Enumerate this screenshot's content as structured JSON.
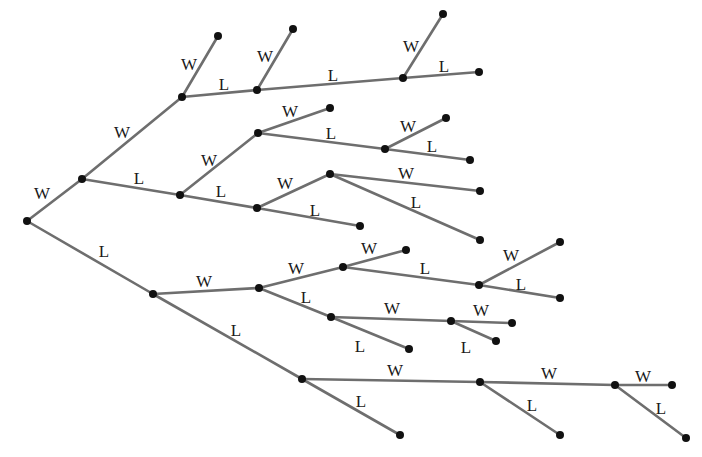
{
  "diagram": {
    "type": "win-loss tree",
    "branch_labels": {
      "win": "W",
      "loss": "L"
    },
    "colors": {
      "edge": "#6e6e6e",
      "node": "#111111",
      "text": "#1a1a1a",
      "background": "#ffffff"
    },
    "nodes": [
      {
        "id": "n0",
        "x": 27,
        "y": 221
      },
      {
        "id": "n1",
        "x": 82,
        "y": 179
      },
      {
        "id": "n2",
        "x": 153,
        "y": 294
      },
      {
        "id": "n3",
        "x": 182,
        "y": 97
      },
      {
        "id": "n4",
        "x": 180,
        "y": 195
      },
      {
        "id": "n5",
        "x": 218,
        "y": 36
      },
      {
        "id": "n6",
        "x": 257,
        "y": 90
      },
      {
        "id": "n7",
        "x": 293,
        "y": 29
      },
      {
        "id": "n8",
        "x": 403,
        "y": 78
      },
      {
        "id": "n9",
        "x": 443,
        "y": 14
      },
      {
        "id": "n10",
        "x": 479,
        "y": 72
      },
      {
        "id": "n11",
        "x": 258,
        "y": 133
      },
      {
        "id": "n12",
        "x": 257,
        "y": 208
      },
      {
        "id": "n13",
        "x": 330,
        "y": 108
      },
      {
        "id": "n14",
        "x": 385,
        "y": 149
      },
      {
        "id": "n15",
        "x": 446,
        "y": 118
      },
      {
        "id": "n16",
        "x": 470,
        "y": 160
      },
      {
        "id": "n17",
        "x": 330,
        "y": 174
      },
      {
        "id": "n18",
        "x": 360,
        "y": 226
      },
      {
        "id": "n19",
        "x": 480,
        "y": 191
      },
      {
        "id": "n20",
        "x": 480,
        "y": 240
      },
      {
        "id": "n21",
        "x": 259,
        "y": 288
      },
      {
        "id": "n22",
        "x": 302,
        "y": 379
      },
      {
        "id": "n23",
        "x": 343,
        "y": 267
      },
      {
        "id": "n24",
        "x": 331,
        "y": 317
      },
      {
        "id": "n25",
        "x": 406,
        "y": 250
      },
      {
        "id": "n26",
        "x": 479,
        "y": 285
      },
      {
        "id": "n27",
        "x": 560,
        "y": 242
      },
      {
        "id": "n28",
        "x": 560,
        "y": 298
      },
      {
        "id": "n29",
        "x": 451,
        "y": 321
      },
      {
        "id": "n30",
        "x": 409,
        "y": 349
      },
      {
        "id": "n31",
        "x": 512,
        "y": 323
      },
      {
        "id": "n32",
        "x": 496,
        "y": 341
      },
      {
        "id": "n33",
        "x": 480,
        "y": 382
      },
      {
        "id": "n34",
        "x": 400,
        "y": 435
      },
      {
        "id": "n35",
        "x": 615,
        "y": 385
      },
      {
        "id": "n36",
        "x": 560,
        "y": 435
      },
      {
        "id": "n37",
        "x": 672,
        "y": 385
      },
      {
        "id": "n38",
        "x": 686,
        "y": 438
      }
    ],
    "edges": [
      {
        "from": "n0",
        "to": "n1",
        "label": "W",
        "lx": 42,
        "ly": 195
      },
      {
        "from": "n0",
        "to": "n2",
        "label": "L",
        "lx": 104,
        "ly": 253
      },
      {
        "from": "n1",
        "to": "n3",
        "label": "W",
        "lx": 122,
        "ly": 134
      },
      {
        "from": "n1",
        "to": "n4",
        "label": "L",
        "lx": 139,
        "ly": 180
      },
      {
        "from": "n3",
        "to": "n5",
        "label": "W",
        "lx": 189,
        "ly": 66
      },
      {
        "from": "n3",
        "to": "n6",
        "label": "L",
        "lx": 224,
        "ly": 86
      },
      {
        "from": "n6",
        "to": "n7",
        "label": "W",
        "lx": 265,
        "ly": 58
      },
      {
        "from": "n6",
        "to": "n8",
        "label": "L",
        "lx": 333,
        "ly": 77
      },
      {
        "from": "n8",
        "to": "n9",
        "label": "W",
        "lx": 411,
        "ly": 48
      },
      {
        "from": "n8",
        "to": "n10",
        "label": "L",
        "lx": 444,
        "ly": 68
      },
      {
        "from": "n4",
        "to": "n11",
        "label": "W",
        "lx": 209,
        "ly": 162
      },
      {
        "from": "n4",
        "to": "n12",
        "label": "L",
        "lx": 221,
        "ly": 193
      },
      {
        "from": "n11",
        "to": "n13",
        "label": "W",
        "lx": 290,
        "ly": 113
      },
      {
        "from": "n11",
        "to": "n14",
        "label": "L",
        "lx": 331,
        "ly": 135
      },
      {
        "from": "n14",
        "to": "n15",
        "label": "W",
        "lx": 408,
        "ly": 128
      },
      {
        "from": "n14",
        "to": "n16",
        "label": "L",
        "lx": 432,
        "ly": 148
      },
      {
        "from": "n12",
        "to": "n17",
        "label": "W",
        "lx": 285,
        "ly": 185
      },
      {
        "from": "n12",
        "to": "n18",
        "label": "L",
        "lx": 315,
        "ly": 212
      },
      {
        "from": "n17",
        "to": "n19",
        "label": "W",
        "lx": 406,
        "ly": 175
      },
      {
        "from": "n17",
        "to": "n20",
        "label": "L",
        "lx": 416,
        "ly": 204
      },
      {
        "from": "n2",
        "to": "n21",
        "label": "W",
        "lx": 204,
        "ly": 283
      },
      {
        "from": "n2",
        "to": "n22",
        "label": "L",
        "lx": 236,
        "ly": 332
      },
      {
        "from": "n21",
        "to": "n23",
        "label": "W",
        "lx": 296,
        "ly": 270
      },
      {
        "from": "n21",
        "to": "n24",
        "label": "L",
        "lx": 306,
        "ly": 299
      },
      {
        "from": "n23",
        "to": "n25",
        "label": "W",
        "lx": 369,
        "ly": 250
      },
      {
        "from": "n23",
        "to": "n26",
        "label": "L",
        "lx": 425,
        "ly": 270
      },
      {
        "from": "n26",
        "to": "n27",
        "label": "W",
        "lx": 511,
        "ly": 257
      },
      {
        "from": "n26",
        "to": "n28",
        "label": "L",
        "lx": 521,
        "ly": 286
      },
      {
        "from": "n24",
        "to": "n29",
        "label": "W",
        "lx": 392,
        "ly": 310
      },
      {
        "from": "n24",
        "to": "n30",
        "label": "L",
        "lx": 360,
        "ly": 348
      },
      {
        "from": "n29",
        "to": "n31",
        "label": "W",
        "lx": 481,
        "ly": 312
      },
      {
        "from": "n29",
        "to": "n32",
        "label": "L",
        "lx": 466,
        "ly": 349
      },
      {
        "from": "n22",
        "to": "n33",
        "label": "W",
        "lx": 395,
        "ly": 372
      },
      {
        "from": "n22",
        "to": "n34",
        "label": "L",
        "lx": 361,
        "ly": 403
      },
      {
        "from": "n33",
        "to": "n35",
        "label": "W",
        "lx": 549,
        "ly": 375
      },
      {
        "from": "n33",
        "to": "n36",
        "label": "L",
        "lx": 532,
        "ly": 407
      },
      {
        "from": "n35",
        "to": "n37",
        "label": "W",
        "lx": 643,
        "ly": 378
      },
      {
        "from": "n35",
        "to": "n38",
        "label": "L",
        "lx": 661,
        "ly": 410
      }
    ]
  }
}
